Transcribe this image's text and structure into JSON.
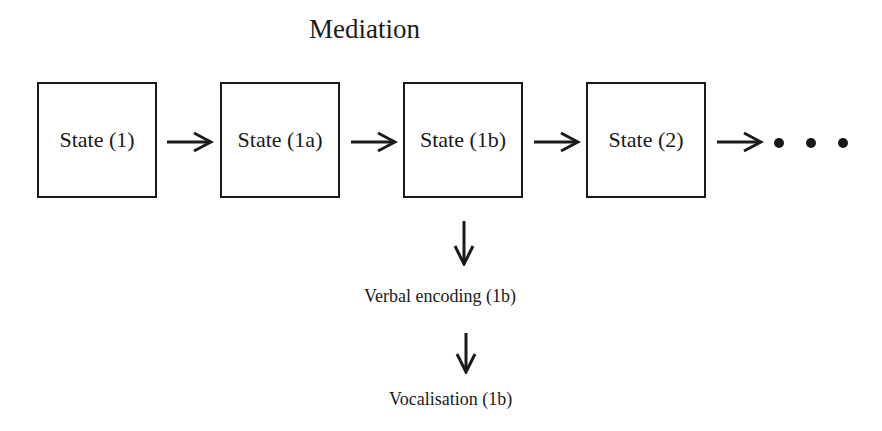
{
  "title": "Mediation",
  "states": [
    {
      "label": "State (1)"
    },
    {
      "label": "State (1a)"
    },
    {
      "label": "State (1b)"
    },
    {
      "label": "State (2)"
    }
  ],
  "continuation": "...",
  "branch": {
    "from": "State (1b)",
    "steps": [
      {
        "label": "Verbal encoding (1b)"
      },
      {
        "label": "Vocalisation (1b)"
      }
    ]
  }
}
